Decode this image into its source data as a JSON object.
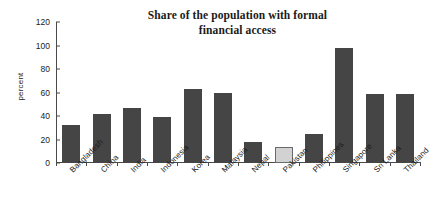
{
  "chart_data": {
    "type": "bar",
    "title": "Share of the population with formal financial access",
    "title_lines": [
      "Share of the population with formal",
      "financial access"
    ],
    "xlabel": "",
    "ylabel": "percent",
    "ylim": [
      0,
      120
    ],
    "yticks": [
      0,
      20,
      40,
      60,
      80,
      100,
      120
    ],
    "ytick_labels": [
      "0",
      "20",
      "40",
      "60",
      "80",
      "100",
      "120"
    ],
    "grid": false,
    "legend": null,
    "categories": [
      "Bangladesh",
      "China",
      "India",
      "Indonesia",
      "Korea",
      "Malaysia",
      "Nepal",
      "Pakistan",
      "Philippines",
      "Singapore",
      "Sri Lanka",
      "Thailand"
    ],
    "values": [
      32,
      42,
      47,
      39,
      63,
      60,
      18,
      14,
      25,
      98,
      59,
      59
    ],
    "highlight_category": "Pakistan",
    "bar_color": "#454545",
    "highlight_color": "#d2d2d2",
    "highlight_border_color": "#6a6a6a",
    "axis_color": "#4a4a4a"
  }
}
